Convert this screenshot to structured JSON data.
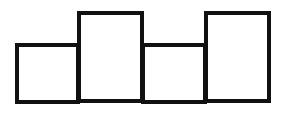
{
  "diagram": {
    "type": "adjacent-rectangles",
    "stroke_color": "#111111",
    "fill_color": "#ffffff",
    "stroke_width": 4,
    "boxes": [
      {
        "x": 15,
        "y": 43,
        "w": 65,
        "h": 61,
        "relative_height": "short"
      },
      {
        "x": 77,
        "y": 11,
        "w": 67,
        "h": 92,
        "relative_height": "tall"
      },
      {
        "x": 141,
        "y": 43,
        "w": 66,
        "h": 61,
        "relative_height": "short"
      },
      {
        "x": 204,
        "y": 11,
        "w": 67,
        "h": 92,
        "relative_height": "tall"
      }
    ]
  }
}
